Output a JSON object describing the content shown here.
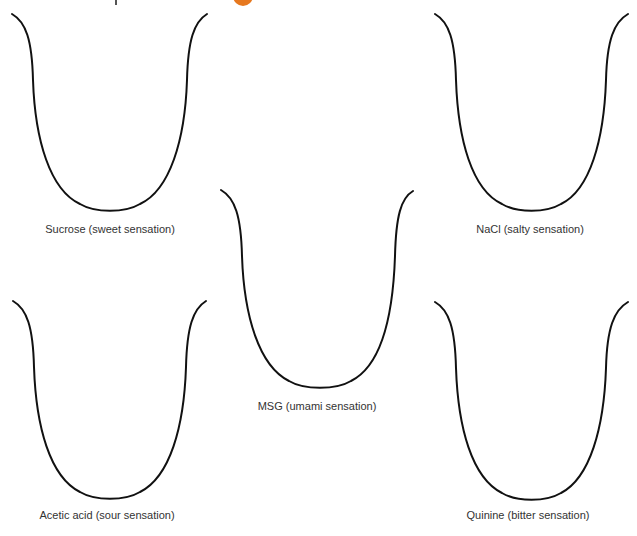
{
  "figure": {
    "accent_color": "#e6781f",
    "outline_color": "#111111",
    "panels": [
      {
        "id": "sucrose",
        "label": "Sucrose (sweet sensation)",
        "taste": "sweet",
        "stimulus": "Sucrose"
      },
      {
        "id": "nacl",
        "label": "NaCl (salty sensation)",
        "taste": "salty",
        "stimulus": "NaCl"
      },
      {
        "id": "msg",
        "label": "MSG (umami sensation)",
        "taste": "umami",
        "stimulus": "MSG"
      },
      {
        "id": "acetic",
        "label": "Acetic acid (sour sensation)",
        "taste": "sour",
        "stimulus": "Acetic acid"
      },
      {
        "id": "quinine",
        "label": "Quinine (bitter sensation)",
        "taste": "bitter",
        "stimulus": "Quinine"
      }
    ]
  }
}
